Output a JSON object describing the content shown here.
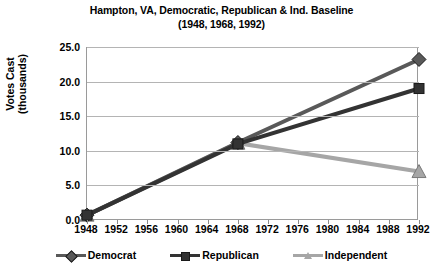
{
  "chart": {
    "title_line1": "Hampton, VA, Democratic, Republican & Ind. Baseline",
    "title_line2": "(1948, 1968, 1992)",
    "ylabel_line1": "Votes Cast",
    "ylabel_line2": "(thousands)"
  },
  "chart_data": {
    "type": "line",
    "title": "Hampton, VA, Democratic, Republican & Ind. Baseline (1948, 1968, 1992)",
    "xlabel": "",
    "ylabel": "Votes Cast (thousands)",
    "x": [
      1948,
      1968,
      1992
    ],
    "xlim": [
      1948,
      1992
    ],
    "ylim": [
      0.0,
      25.0
    ],
    "yticks": [
      "0.0",
      "5.0",
      "10.0",
      "15.0",
      "20.0",
      "25.0"
    ],
    "ytick_values": [
      0.0,
      5.0,
      10.0,
      15.0,
      20.0,
      25.0
    ],
    "xticks": [
      "1948",
      "1952",
      "1956",
      "1960",
      "1964",
      "1968",
      "1972",
      "1976",
      "1980",
      "1984",
      "1988",
      "1992"
    ],
    "xtick_values": [
      1948,
      1952,
      1956,
      1960,
      1964,
      1968,
      1972,
      1976,
      1980,
      1984,
      1988,
      1992
    ],
    "grid": true,
    "legend_position": "bottom",
    "series": [
      {
        "name": "Democrat",
        "marker": "diamond",
        "color": "#595959",
        "values": [
          0.7,
          11.2,
          23.2
        ]
      },
      {
        "name": "Republican",
        "marker": "square",
        "color": "#333333",
        "values": [
          0.7,
          11.0,
          19.0
        ]
      },
      {
        "name": "Independent",
        "marker": "triangle",
        "color": "#a6a6a6",
        "values": [
          0.7,
          11.1,
          7.0
        ]
      }
    ]
  }
}
